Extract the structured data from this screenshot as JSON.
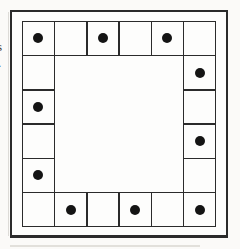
{
  "colors": {
    "page_bg": "#fbfaf8",
    "board_bg": "#fdfdfc",
    "line_color": "#2b2b2b",
    "dot_color": "#141414"
  },
  "edge_text_fragments": [
    {
      "char": "s"
    },
    {
      "char": "."
    },
    {
      "char": "t"
    }
  ],
  "figure": {
    "grid_size": 6,
    "ring_cell_count": 20,
    "dot_count": 10,
    "cells": [
      {
        "row": 1,
        "col": 1,
        "dot": true
      },
      {
        "row": 1,
        "col": 2,
        "dot": false
      },
      {
        "row": 1,
        "col": 3,
        "dot": true
      },
      {
        "row": 1,
        "col": 4,
        "dot": false
      },
      {
        "row": 1,
        "col": 5,
        "dot": true
      },
      {
        "row": 1,
        "col": 6,
        "dot": false
      },
      {
        "row": 2,
        "col": 1,
        "dot": false
      },
      {
        "row": 2,
        "col": 6,
        "dot": true
      },
      {
        "row": 3,
        "col": 1,
        "dot": true
      },
      {
        "row": 3,
        "col": 6,
        "dot": false
      },
      {
        "row": 4,
        "col": 1,
        "dot": false
      },
      {
        "row": 4,
        "col": 6,
        "dot": true
      },
      {
        "row": 5,
        "col": 1,
        "dot": true
      },
      {
        "row": 5,
        "col": 6,
        "dot": false
      },
      {
        "row": 6,
        "col": 1,
        "dot": false
      },
      {
        "row": 6,
        "col": 2,
        "dot": true
      },
      {
        "row": 6,
        "col": 3,
        "dot": false
      },
      {
        "row": 6,
        "col": 4,
        "dot": true
      },
      {
        "row": 6,
        "col": 5,
        "dot": false
      },
      {
        "row": 6,
        "col": 6,
        "dot": true
      }
    ]
  }
}
